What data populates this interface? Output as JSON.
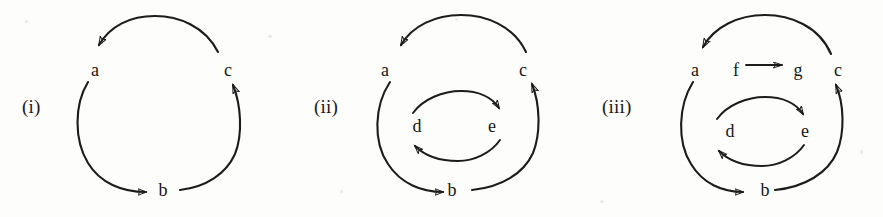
{
  "figure": {
    "background_color": "#fdfdfc",
    "stroke_color": "#1c1c1c",
    "text_color": "#161616",
    "width": 883,
    "height": 217
  },
  "panels": [
    {
      "id": "panel-i",
      "label": "(i)",
      "nodes": [
        {
          "name": "a",
          "text": "a",
          "x": 95,
          "y": 70
        },
        {
          "name": "c",
          "text": "c",
          "x": 228,
          "y": 70
        },
        {
          "name": "b",
          "text": "b",
          "x": 163,
          "y": 190
        }
      ],
      "edges": [
        {
          "from": "b",
          "to": "c",
          "style": "arc",
          "direction": "up-right"
        },
        {
          "from": "c",
          "to": "a",
          "style": "arc",
          "direction": "over-top"
        },
        {
          "from": "a",
          "to": "b",
          "style": "arc",
          "direction": "down-right"
        }
      ],
      "cycle": "a -> b -> c -> a"
    },
    {
      "id": "panel-ii",
      "label": "(ii)",
      "nodes": [
        {
          "name": "a",
          "text": "a",
          "x": 385,
          "y": 70
        },
        {
          "name": "c",
          "text": "c",
          "x": 523,
          "y": 70
        },
        {
          "name": "b",
          "text": "b",
          "x": 452,
          "y": 190
        },
        {
          "name": "d",
          "text": "d",
          "x": 417,
          "y": 126
        },
        {
          "name": "e",
          "text": "e",
          "x": 492,
          "y": 126
        }
      ],
      "edges": [
        {
          "from": "b",
          "to": "c",
          "style": "arc",
          "direction": "up-right"
        },
        {
          "from": "c",
          "to": "a",
          "style": "arc",
          "direction": "over-top"
        },
        {
          "from": "a",
          "to": "b",
          "style": "arc",
          "direction": "down-right"
        },
        {
          "from": "d",
          "to": "e",
          "style": "arc",
          "direction": "over-top"
        },
        {
          "from": "e",
          "to": "d",
          "style": "arc",
          "direction": "under-bottom"
        }
      ],
      "cycle": "a -> b -> c -> a, d -> e -> d"
    },
    {
      "id": "panel-iii",
      "label": "(iii)",
      "nodes": [
        {
          "name": "a",
          "text": "a",
          "x": 695,
          "y": 70
        },
        {
          "name": "f",
          "text": "f",
          "x": 736,
          "y": 70
        },
        {
          "name": "g",
          "text": "g",
          "x": 798,
          "y": 70
        },
        {
          "name": "c",
          "text": "c",
          "x": 838,
          "y": 70
        },
        {
          "name": "b",
          "text": "b",
          "x": 765,
          "y": 190
        },
        {
          "name": "d",
          "text": "d",
          "x": 730,
          "y": 131
        },
        {
          "name": "e",
          "text": "e",
          "x": 805,
          "y": 131
        }
      ],
      "edges": [
        {
          "from": "b",
          "to": "c",
          "style": "arc",
          "direction": "up-right"
        },
        {
          "from": "c",
          "to": "a",
          "style": "arc",
          "direction": "over-top"
        },
        {
          "from": "a",
          "to": "b",
          "style": "arc",
          "direction": "down-right"
        },
        {
          "from": "d",
          "to": "e",
          "style": "arc",
          "direction": "over-top"
        },
        {
          "from": "e",
          "to": "d",
          "style": "arc",
          "direction": "under-bottom"
        },
        {
          "from": "f",
          "to": "g",
          "style": "straight",
          "direction": "right"
        }
      ],
      "cycle": "a -> b -> c -> a, d -> e -> d, f -> g"
    }
  ]
}
